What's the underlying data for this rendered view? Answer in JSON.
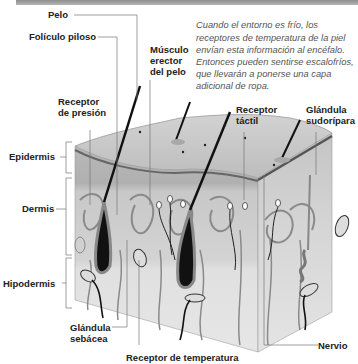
{
  "caption": "Cuando el entorno es frío, los receptores de temperatura de la piel envían esta información al encéfalo. Entonces pueden sentirse escalofríos, que llevarán a ponerse una capa adicional de ropa.",
  "labels": {
    "pelo": "Pelo",
    "foliculo": "Folículo piloso",
    "musculo_l1": "Músculo",
    "musculo_l2": "erector",
    "musculo_l3": "del pelo",
    "presion_l1": "Receptor",
    "presion_l2": "de presión",
    "tactil_l1": "Receptor",
    "tactil_l2": "táctil",
    "sudoripara_l1": "Glándula",
    "sudoripara_l2": "sudorípara",
    "epidermis": "Epidermis",
    "dermis": "Dermis",
    "hipodermis": "Hipodermis",
    "sebacea_l1": "Glándula",
    "sebacea_l2": "sebácea",
    "temperatura": "Receptor de temperatura",
    "nervio": "Nervio"
  },
  "colors": {
    "epidermis_top": "#c9c9c9",
    "dermis": "#d8d8d8",
    "hipodermis": "#e6e6e6",
    "dark": "#111111"
  }
}
